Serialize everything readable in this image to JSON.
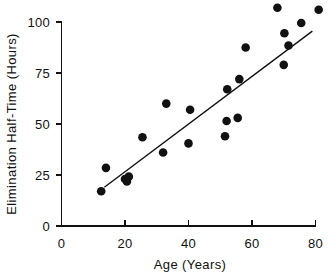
{
  "chart_data": {
    "type": "scatter",
    "title": "",
    "xlabel": "Age (Years)",
    "ylabel": "Elimination Half-Time (Hours)",
    "xlim": [
      0,
      80
    ],
    "ylim": [
      0,
      100
    ],
    "xticks": [
      0,
      20,
      40,
      60,
      80
    ],
    "yticks": [
      0,
      25,
      50,
      75,
      100
    ],
    "xticklabels": [
      "0",
      "20",
      "40",
      "60",
      "80"
    ],
    "yticklabels": [
      "0",
      "25",
      "50",
      "75",
      "100"
    ],
    "grid": false,
    "legend": false,
    "marker": "filled-circle",
    "marker_color": "#111111",
    "series": [
      {
        "name": "Patients",
        "x": [
          12.5,
          14.0,
          20.0,
          20.6,
          21.2,
          25.5,
          32.0,
          33.0,
          40.0,
          40.5,
          51.5,
          52.0,
          52.2,
          55.5,
          56.0,
          58.0,
          68.0,
          70.0,
          70.2,
          71.5,
          75.5,
          81.0
        ],
        "y": [
          17.0,
          28.5,
          23.0,
          21.8,
          24.2,
          43.5,
          36.0,
          60.0,
          40.5,
          57.0,
          44.0,
          51.5,
          67.0,
          53.0,
          72.0,
          87.5,
          107.0,
          79.0,
          94.5,
          88.5,
          99.5,
          106.0
        ]
      }
    ],
    "fit_line": {
      "name": "Regression line",
      "x_start": 13.5,
      "y_start": 19.0,
      "x_end": 79.0,
      "y_end": 95.5,
      "color": "#111111"
    }
  },
  "axes": {
    "x_title": "Age (Years)",
    "y_title": "Elimination Half-Time (Hours)",
    "x_tick_labels": [
      "0",
      "20",
      "40",
      "60",
      "80"
    ],
    "y_tick_labels": [
      "0",
      "25",
      "50",
      "75",
      "100"
    ]
  }
}
